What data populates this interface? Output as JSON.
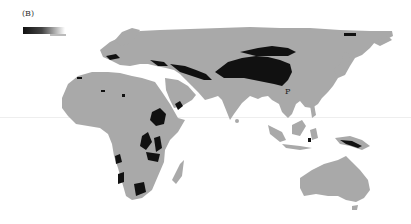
{
  "figure": {
    "panel_label": "(B)",
    "annotation_label": "P",
    "colors": {
      "background": "#ffffff",
      "land": "#a9a9a9",
      "highland": "#111111",
      "legend_gradient_start": "#111111",
      "legend_gradient_end": "#ffffff"
    },
    "regions_shown": [
      "Europe",
      "Africa",
      "Asia",
      "Australia",
      "Oceania"
    ],
    "legend": {
      "type": "gradient-bar",
      "position": "top-left"
    }
  }
}
